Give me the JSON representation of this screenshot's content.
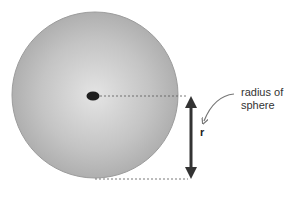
{
  "diagram": {
    "labels": {
      "annotation": [
        "radius of",
        "sphere"
      ],
      "symbol": "r"
    },
    "colors": {
      "sphere_center": "#e2e2e2",
      "sphere_edge": "#a8a8a8",
      "center_dot": "#1e1e1e",
      "arrow": "#333333",
      "dashed_line": "#555555"
    }
  }
}
